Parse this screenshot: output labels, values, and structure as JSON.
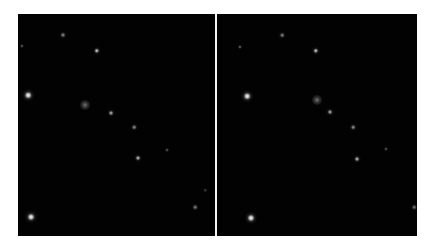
{
  "figure": {
    "background_color": "#ffffff",
    "panel_color": "#020202",
    "divider_color": "#f4f4f4"
  },
  "panels": [
    {
      "name": "left",
      "x": 18,
      "y": 14,
      "w": 197,
      "h": 222,
      "stars": [
        {
          "x": 63,
          "y": 35,
          "r": 2.0,
          "b": 0.55,
          "fuzzy": false
        },
        {
          "x": 22,
          "y": 46,
          "r": 1.6,
          "b": 0.35,
          "fuzzy": false
        },
        {
          "x": 97,
          "y": 51,
          "r": 2.2,
          "b": 0.8,
          "fuzzy": false
        },
        {
          "x": 28,
          "y": 95,
          "r": 2.8,
          "b": 1.0,
          "fuzzy": false
        },
        {
          "x": 85,
          "y": 105,
          "r": 5.0,
          "b": 0.45,
          "fuzzy": true
        },
        {
          "x": 111,
          "y": 113,
          "r": 2.0,
          "b": 0.7,
          "fuzzy": false
        },
        {
          "x": 134,
          "y": 127,
          "r": 1.8,
          "b": 0.55,
          "fuzzy": false
        },
        {
          "x": 138,
          "y": 158,
          "r": 2.0,
          "b": 0.75,
          "fuzzy": false
        },
        {
          "x": 167,
          "y": 150,
          "r": 1.5,
          "b": 0.35,
          "fuzzy": false
        },
        {
          "x": 205,
          "y": 190,
          "r": 1.3,
          "b": 0.25,
          "fuzzy": false
        },
        {
          "x": 195,
          "y": 207,
          "r": 1.8,
          "b": 0.5,
          "fuzzy": false
        },
        {
          "x": 31,
          "y": 217,
          "r": 3.0,
          "b": 1.0,
          "fuzzy": false
        }
      ]
    },
    {
      "name": "right",
      "x": 217,
      "y": 14,
      "w": 200,
      "h": 222,
      "stars": [
        {
          "x": 282,
          "y": 35,
          "r": 1.8,
          "b": 0.5,
          "fuzzy": false
        },
        {
          "x": 240,
          "y": 47,
          "r": 1.6,
          "b": 0.4,
          "fuzzy": false
        },
        {
          "x": 316,
          "y": 51,
          "r": 2.2,
          "b": 0.8,
          "fuzzy": false
        },
        {
          "x": 247,
          "y": 96,
          "r": 2.8,
          "b": 1.0,
          "fuzzy": false
        },
        {
          "x": 317,
          "y": 100,
          "r": 5.0,
          "b": 0.45,
          "fuzzy": true
        },
        {
          "x": 330,
          "y": 112,
          "r": 2.0,
          "b": 0.7,
          "fuzzy": false
        },
        {
          "x": 353,
          "y": 127,
          "r": 1.8,
          "b": 0.55,
          "fuzzy": false
        },
        {
          "x": 386,
          "y": 149,
          "r": 1.5,
          "b": 0.35,
          "fuzzy": false
        },
        {
          "x": 357,
          "y": 159,
          "r": 2.0,
          "b": 0.75,
          "fuzzy": false
        },
        {
          "x": 414,
          "y": 207,
          "r": 1.8,
          "b": 0.45,
          "fuzzy": false
        },
        {
          "x": 251,
          "y": 218,
          "r": 3.0,
          "b": 1.0,
          "fuzzy": false
        }
      ]
    }
  ],
  "divider": {
    "x": 215,
    "y": 14,
    "w": 2,
    "h": 222
  }
}
